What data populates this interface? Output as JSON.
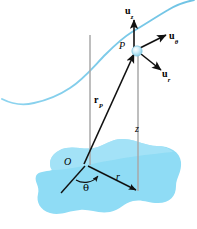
{
  "figure": {
    "background_color": "#ffffff",
    "width": 197,
    "height": 229
  },
  "colors": {
    "plane_fill": "#8fdcf5",
    "plane_fill_light": "#a9e4f7",
    "curve": "#7ec9e8",
    "axis_gray": "#a8a8a8",
    "vector_black": "#111111",
    "point_sphere": "#bfe7f7",
    "point_sphere_edge": "#7fc4de",
    "label_black": "#000000"
  },
  "labels": {
    "unit_vector_z": {
      "base": "u",
      "sub": "z"
    },
    "unit_vector_theta": {
      "base": "u",
      "sub": "θ"
    },
    "unit_vector_r": {
      "base": "u",
      "sub": "r"
    },
    "point": "P",
    "position_vector": {
      "base": "r",
      "sub": "P"
    },
    "height_z": "z",
    "origin": "O",
    "angle_theta": "θ",
    "radius_r": "r"
  },
  "elements": {
    "plane_region": "horizontal-reference-plane-blob",
    "space_curve": "particle-path-curve",
    "vertical_reference_axis": "gray-vertical-axis-through-origin",
    "vertical_drop_line": "z-height-line-from-P-to-plane",
    "position_vector_arrow": "arrow-from-O-to-P",
    "radial_arrow": "arrow-from-O-to-projection",
    "angle_arc": "theta-angle-arc-at-origin",
    "reference_line": "theta-reference-datum-line"
  }
}
